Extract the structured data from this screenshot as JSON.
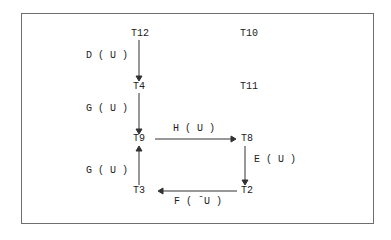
{
  "diagram": {
    "type": "state-transition",
    "nodes": [
      {
        "id": "T12",
        "label": "T12"
      },
      {
        "id": "T10",
        "label": "T10"
      },
      {
        "id": "T4",
        "label": "T4"
      },
      {
        "id": "T11",
        "label": "T11"
      },
      {
        "id": "T9",
        "label": "T9"
      },
      {
        "id": "T8",
        "label": "T8"
      },
      {
        "id": "T3",
        "label": "T3"
      },
      {
        "id": "T2",
        "label": "T2"
      }
    ],
    "edges": [
      {
        "from": "T12",
        "to": "T4",
        "label": "D ( U )"
      },
      {
        "from": "T4",
        "to": "T9",
        "label": "G ( U )"
      },
      {
        "from": "T9",
        "to": "T8",
        "label": "H ( U )"
      },
      {
        "from": "T8",
        "to": "T2",
        "label": "E ( U )"
      },
      {
        "from": "T2",
        "to": "T3",
        "label": "F ( ˉU )"
      },
      {
        "from": "T3",
        "to": "T9",
        "label": "G ( U )"
      }
    ]
  }
}
